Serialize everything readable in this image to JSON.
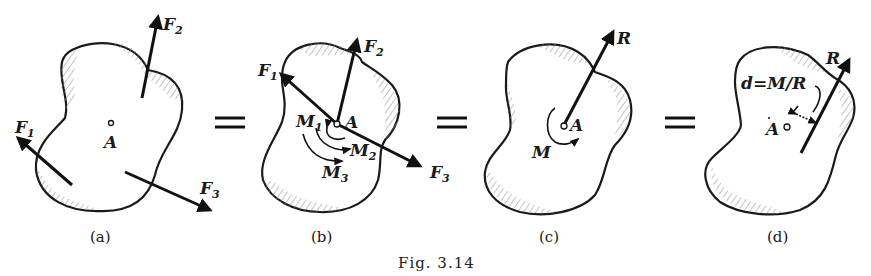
{
  "figure": {
    "caption": "Fig. 3.14",
    "colors": {
      "ink": "#1a1a1a",
      "background": "#ffffff",
      "hatch": "#888888"
    }
  },
  "panels": [
    {
      "id": "a",
      "label": "(a)",
      "point": "A",
      "forces": [
        {
          "name": "F",
          "sub": "1"
        },
        {
          "name": "F",
          "sub": "2"
        },
        {
          "name": "F",
          "sub": "3"
        }
      ]
    },
    {
      "id": "b",
      "label": "(b)",
      "point": "A",
      "forces": [
        {
          "name": "F",
          "sub": "1"
        },
        {
          "name": "F",
          "sub": "2"
        },
        {
          "name": "F",
          "sub": "3"
        }
      ],
      "moments": [
        {
          "name": "M",
          "sub": "1"
        },
        {
          "name": "M",
          "sub": "2"
        },
        {
          "name": "M",
          "sub": "3"
        }
      ]
    },
    {
      "id": "c",
      "label": "(c)",
      "point": "A",
      "resultant": "R",
      "moment": "M"
    },
    {
      "id": "d",
      "label": "(d)",
      "point": "A",
      "resultant": "R",
      "distance_formula": "d=M/R"
    }
  ],
  "equals": [
    "=",
    "=",
    "="
  ]
}
